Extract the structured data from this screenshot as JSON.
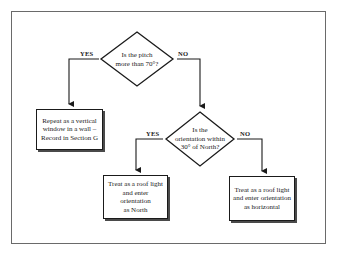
{
  "flowchart": {
    "decisions": [
      {
        "id": "pitch",
        "lines": [
          "Is the pitch",
          "more than 70°?"
        ],
        "yes_label": "YES",
        "no_label": "NO"
      },
      {
        "id": "orientation",
        "lines": [
          "Is the",
          "orientation within",
          "30° of North?"
        ],
        "yes_label": "YES",
        "no_label": "NO"
      }
    ],
    "outcomes": [
      {
        "id": "vertical-window",
        "lines": [
          "Repeat as a vertical",
          "window in a wall –",
          "Record in Section G"
        ]
      },
      {
        "id": "roof-light-north",
        "lines": [
          "Treat as a roof light",
          "and enter orientation",
          "as North"
        ]
      },
      {
        "id": "roof-light-horizontal",
        "lines": [
          "Treat as a roof light",
          "and enter orientation",
          "as horizontal"
        ]
      }
    ]
  }
}
